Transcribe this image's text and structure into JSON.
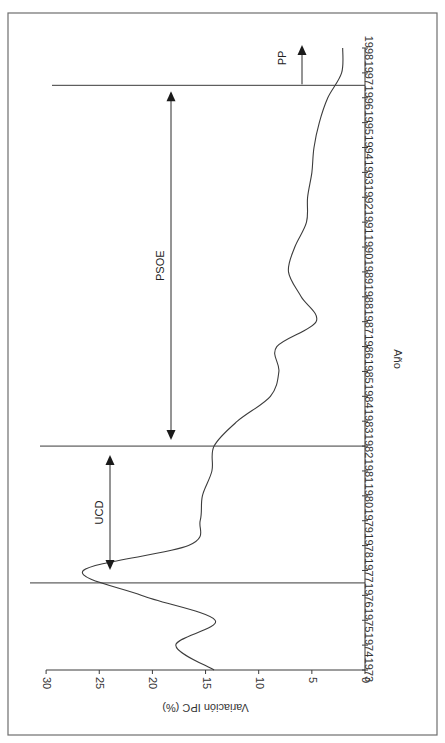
{
  "chart_data": {
    "type": "line",
    "orientation": "rotated 90° clockwise (x-axis runs vertically, years increasing upward; y-axis runs horizontally, values increasing leftward)",
    "title": "",
    "xlabel": "Año",
    "ylabel": "Variación IPC (%)",
    "x": [
      1973,
      1974,
      1975,
      1976,
      1977,
      1978,
      1979,
      1980,
      1981,
      1982,
      1983,
      1984,
      1985,
      1986,
      1987,
      1988,
      1989,
      1990,
      1991,
      1992,
      1993,
      1994,
      1995,
      1996,
      1997,
      1998
    ],
    "series": [
      {
        "name": "Variación IPC (%)",
        "values": [
          14.2,
          17.8,
          14.1,
          21.0,
          26.5,
          16.6,
          15.5,
          15.3,
          14.4,
          14.2,
          12.0,
          8.9,
          8.1,
          8.3,
          4.6,
          6.0,
          7.2,
          6.6,
          5.5,
          5.4,
          5.0,
          4.8,
          4.3,
          3.5,
          2.2,
          2.1
        ]
      }
    ],
    "xticks": [
      "1973",
      "1974",
      "1975",
      "1976",
      "1977",
      "1978",
      "1979",
      "1980",
      "1981",
      "1982",
      "1983",
      "1984",
      "1985",
      "1986",
      "1987",
      "1988",
      "1989",
      "1990",
      "1991",
      "1992",
      "1993",
      "1994",
      "1995",
      "1996",
      "1997",
      "1998"
    ],
    "yticks": [
      "0",
      "5",
      "10",
      "15",
      "20",
      "25",
      "30"
    ],
    "ylim": [
      0,
      30
    ],
    "xlim": [
      1973,
      1998
    ],
    "grid": false,
    "legend": null,
    "annotations": [
      {
        "label": "UCD",
        "type": "double-arrow",
        "from": 1977,
        "to": 1982
      },
      {
        "label": "PSOE",
        "type": "double-arrow",
        "from": 1982,
        "to": 1996.5
      },
      {
        "label": "PP",
        "type": "arrow",
        "from": 1996.5,
        "to": 1998
      }
    ],
    "reference_lines": [
      1976.5,
      1982,
      1996.5
    ]
  }
}
